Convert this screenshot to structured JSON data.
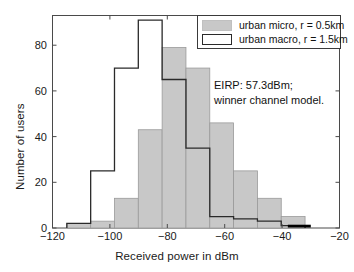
{
  "chart_data": {
    "type": "bar",
    "title": "",
    "subtitle": "",
    "xlabel": "Received power in dBm",
    "ylabel": "Number of users",
    "xlim": [
      -120,
      -20
    ],
    "ylim": [
      0,
      93
    ],
    "xticks": [
      -120,
      -100,
      -80,
      -60,
      -40,
      -20
    ],
    "xtick_labels": [
      "−120",
      "−100",
      "−80",
      "−60",
      "−40",
      "−20"
    ],
    "yticks": [
      0,
      20,
      40,
      60,
      80
    ],
    "ytick_labels": [
      "0",
      "20",
      "40",
      "60",
      "80"
    ],
    "grid": false,
    "legend_position": "top-right",
    "bin_width": 8.3,
    "bin_edges": [
      -115.0,
      -106.7,
      -98.4,
      -90.1,
      -81.8,
      -73.5,
      -65.2,
      -56.9,
      -48.6,
      -40.3,
      -32.0
    ],
    "bin_centers": [
      -110.85,
      -102.55,
      -94.25,
      -85.95,
      -77.65,
      -69.35,
      -61.05,
      -52.75,
      -44.45,
      -36.15
    ],
    "series": [
      {
        "name": "urban micro, r = 0.5km",
        "style": "filled",
        "color": "#c8c8c8",
        "edge_color": "#9a9a9a",
        "values": [
          2,
          3,
          13,
          43,
          79,
          70,
          46,
          25,
          13,
          5
        ]
      },
      {
        "name": "urban macro, r = 1.5km",
        "style": "outlined",
        "color": "#ffffff",
        "edge_color": "#2a2a2a",
        "values": [
          2,
          25,
          70,
          91,
          65,
          35,
          5,
          4,
          3,
          1
        ]
      }
    ],
    "extra_marks": [
      {
        "name": "black-bar-marker",
        "color": "#000000",
        "x_start": -38.0,
        "x_end": -30.0,
        "value": 1
      }
    ],
    "annotations": [
      {
        "line": "EIRP: 57.3dBm;"
      },
      {
        "line": "winner channel model."
      }
    ]
  },
  "legend": {
    "items": [
      {
        "label": "urban micro, r = 0.5km"
      },
      {
        "label": "urban macro, r = 1.5km"
      }
    ]
  }
}
